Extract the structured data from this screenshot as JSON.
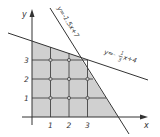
{
  "diagram": {
    "axes": {
      "x_label": "x",
      "y_label": "y"
    },
    "x_ticks": [
      "1",
      "2",
      "3"
    ],
    "y_ticks": [
      "1",
      "2",
      "3"
    ],
    "lines": [
      {
        "label": "y=-1.5x+7",
        "slope": -1.5,
        "intercept": 7
      },
      {
        "label_prefix": "y=-",
        "label_num": "1",
        "label_den": "3",
        "label_suffix": "x+4",
        "slope": -0.3333,
        "intercept": 4
      }
    ],
    "feasible_region": {
      "description": "shaded region x>=0, y>=0, below both lines",
      "fill": "#cfcfcf"
    },
    "lattice_points": [
      [
        1,
        1
      ],
      [
        2,
        1
      ],
      [
        3,
        1
      ],
      [
        1,
        2
      ],
      [
        2,
        2
      ],
      [
        3,
        2
      ],
      [
        1,
        3
      ],
      [
        2,
        3
      ]
    ],
    "colors": {
      "line": "#333333",
      "shade": "#d0d0d0",
      "grid": "#444444"
    }
  }
}
